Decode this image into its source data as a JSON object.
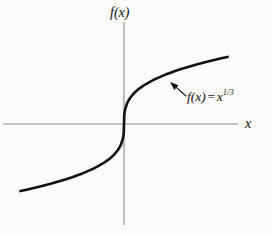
{
  "figure": {
    "background_color": "#fbfbfa",
    "ink_color": "#111111",
    "axis_color": "#8a8a8a"
  },
  "labels": {
    "y_axis": "f(x)",
    "x_axis": "x",
    "equation_lhs": "f(x)",
    "equation_equals": "=",
    "equation_base": "x",
    "equation_exponent": "1/3",
    "equation_full": "f(x) = x^(1/3)"
  },
  "chart_data": {
    "type": "line",
    "title": "",
    "subtitle": "",
    "xlabel": "x",
    "ylabel": "f(x)",
    "legend": [
      "f(x) = x^(1/3)"
    ],
    "legend_position": "inline-annotation-right",
    "grid": false,
    "axes": {
      "origin_px": [
        124,
        124
      ],
      "x_axis_span_px": [
        3,
        238
      ],
      "y_axis_span_px": [
        22,
        225
      ],
      "x_arrow_tip_px": [
        238,
        124
      ],
      "show_ticks": false,
      "show_tick_labels": false
    },
    "xlim": [
      -5.5,
      5.5
    ],
    "ylim": [
      -2.6,
      2.6
    ],
    "annotations": [
      {
        "text": "f(x) = x^(1/3)",
        "anchor_px": [
          187,
          88
        ],
        "leader_from_px": [
          186,
          96
        ],
        "leader_to_px": [
          170,
          82
        ],
        "arrow": true
      }
    ],
    "series": [
      {
        "name": "f(x) = x^(1/3)",
        "color": "#111111",
        "line_width_px": 2.6,
        "x": [
          -5.0,
          -4.5,
          -4.0,
          -3.5,
          -3.0,
          -2.5,
          -2.0,
          -1.5,
          -1.0,
          -0.75,
          -0.5,
          -0.3,
          -0.15,
          -0.05,
          -0.01,
          0.0,
          0.01,
          0.05,
          0.15,
          0.3,
          0.5,
          0.75,
          1.0,
          1.5,
          2.0,
          2.5,
          3.0,
          3.5,
          4.0,
          4.5,
          5.0
        ],
        "y": [
          -1.71,
          -1.651,
          -1.587,
          -1.518,
          -1.442,
          -1.357,
          -1.26,
          -1.145,
          -1.0,
          -0.909,
          -0.794,
          -0.669,
          -0.531,
          -0.368,
          -0.215,
          0.0,
          0.215,
          0.368,
          0.531,
          0.669,
          0.794,
          0.909,
          1.0,
          1.145,
          1.26,
          1.357,
          1.442,
          1.518,
          1.587,
          1.651,
          1.71
        ]
      }
    ]
  }
}
